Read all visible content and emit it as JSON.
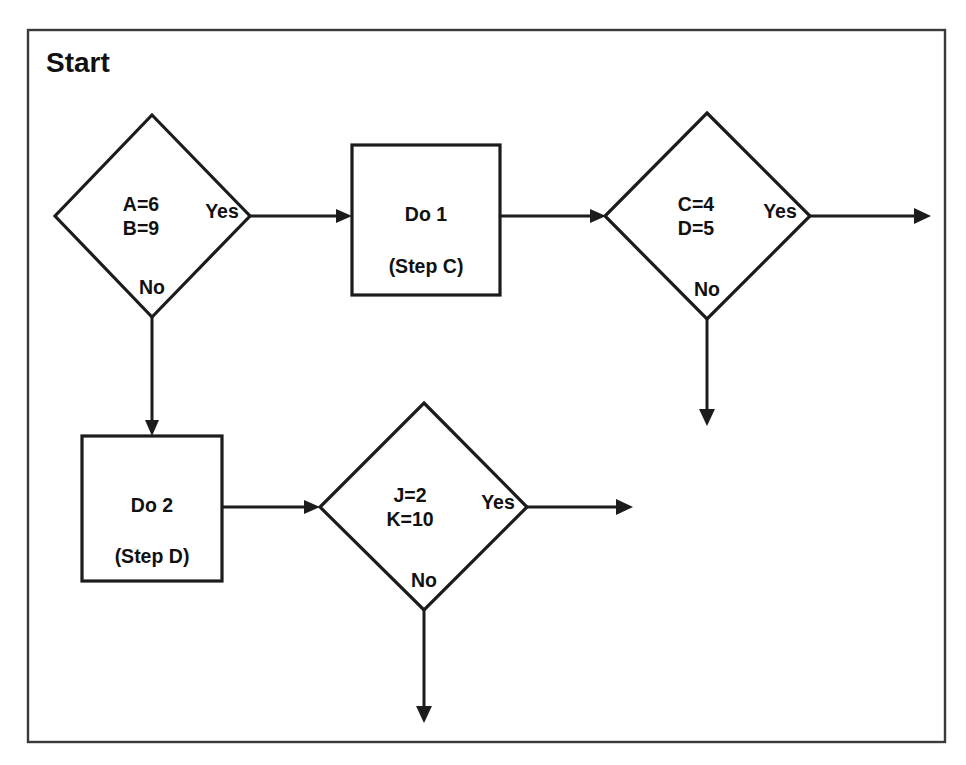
{
  "diagram": {
    "title": "Start",
    "type": "flowchart",
    "frame": {
      "visible": true,
      "border_color": "#3a3a3a"
    },
    "colors": {
      "stroke": "#1c1c1c",
      "fill": "#ffffff",
      "text": "#111111"
    },
    "nodes": [
      {
        "id": "decision-ab",
        "shape": "diamond",
        "lines": [
          "A=6",
          "B=9"
        ],
        "branch_yes": "Yes",
        "branch_no": "No"
      },
      {
        "id": "process-do1",
        "shape": "rectangle",
        "lines": [
          "Do 1",
          "(Step C)"
        ]
      },
      {
        "id": "decision-cd",
        "shape": "diamond",
        "lines": [
          "C=4",
          "D=5"
        ],
        "branch_yes": "Yes",
        "branch_no": "No"
      },
      {
        "id": "process-do2",
        "shape": "rectangle",
        "lines": [
          "Do 2",
          "(Step D)"
        ]
      },
      {
        "id": "decision-jk",
        "shape": "diamond",
        "lines": [
          "J=2",
          "K=10"
        ],
        "branch_yes": "Yes",
        "branch_no": "No"
      }
    ],
    "edges": [
      {
        "from": "decision-ab",
        "to": "process-do1",
        "label": "Yes"
      },
      {
        "from": "decision-ab",
        "to": "process-do2",
        "label": "No"
      },
      {
        "from": "process-do1",
        "to": "decision-cd",
        "label": ""
      },
      {
        "from": "decision-cd",
        "to": "exit-right",
        "label": "Yes"
      },
      {
        "from": "decision-cd",
        "to": "exit-down",
        "label": "No"
      },
      {
        "from": "process-do2",
        "to": "decision-jk",
        "label": ""
      },
      {
        "from": "decision-jk",
        "to": "exit-right",
        "label": "Yes"
      },
      {
        "from": "decision-jk",
        "to": "exit-down",
        "label": "No"
      }
    ]
  }
}
